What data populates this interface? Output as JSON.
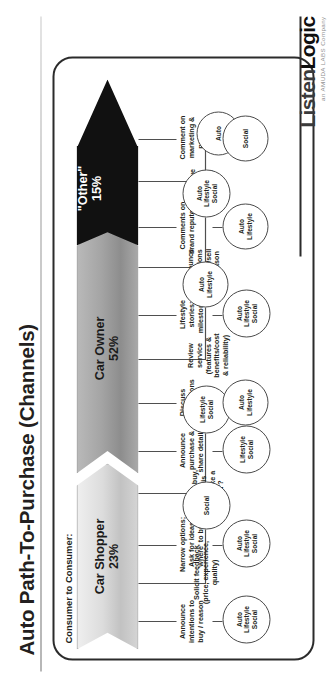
{
  "slide": {
    "title": "Auto Path-To-Purchase (Channels)",
    "section_label": "Consumer to Consumer:"
  },
  "logo": {
    "word_listen": "Listen",
    "word_logic": "Logic",
    "tagline": "an AMUDA LABS Company"
  },
  "stages": [
    {
      "name": "Car Shopper",
      "percent": "23%",
      "color": "#dcdcdc"
    },
    {
      "name": "Car Owner",
      "percent": "52%",
      "color": "#a4a4a4"
    },
    {
      "name": "\"Other\"",
      "percent": "15%",
      "color": "#111111"
    }
  ],
  "nodes": [
    {
      "stage": "Car Shopper",
      "label": "Announce\nintentions to\nbuy / reason",
      "channels": [
        "Auto",
        "Lifestyle",
        "Social"
      ]
    },
    {
      "stage": "Car Shopper",
      "label": "Solicit feedback\n(price, experience,\nquality)",
      "channels": [
        "Auto",
        "Lifestyle",
        "Social"
      ]
    },
    {
      "stage": "Car Shopper",
      "label": "Narrow options;\nAsk for ideas\n'where' to buy",
      "channels": [
        "Social"
      ]
    },
    {
      "stage": "Car Shopper",
      "label": "Before I buy,\ndoes this\nsound like a\n'deal'?",
      "channels": [
        "Lifestyle",
        "Social"
      ]
    },
    {
      "stage": "Car Shopper",
      "label": "Announce\npurchase &\nshare details",
      "channels": [
        "Lifestyle",
        "Social"
      ]
    },
    {
      "stage": "Car Owner",
      "label": "Discuss\nmodifications",
      "channels": [
        "Auto",
        "Lifestyle"
      ]
    },
    {
      "stage": "Car Owner",
      "label": "Review\nservice\n(features &\nbenefits/cost\n& reliability)",
      "channels": [
        "Auto",
        "Lifestyle"
      ]
    },
    {
      "stage": "Car Owner",
      "label": "Lifestyle\nstories;\nmilestones",
      "channels": [
        "Auto",
        "Lifestyle",
        "Social"
      ]
    },
    {
      "stage": "Car Owner",
      "label": "Announce\nintentions\nto buy/sell\n& reason",
      "channels": [
        "Auto",
        "Lifestyle",
        "Social"
      ]
    },
    {
      "stage": "\"Other\"",
      "label": "Comments on\nbrand reputation",
      "channels": [
        "Auto",
        "Lifestyle"
      ]
    },
    {
      "stage": "\"Other\"",
      "label": "Critique\nnew\nmodels",
      "channels": [
        "Auto"
      ]
    },
    {
      "stage": "\"Other\"",
      "label": "Comment on\nmarketing &\npromo",
      "channels": [
        "Social"
      ]
    }
  ]
}
